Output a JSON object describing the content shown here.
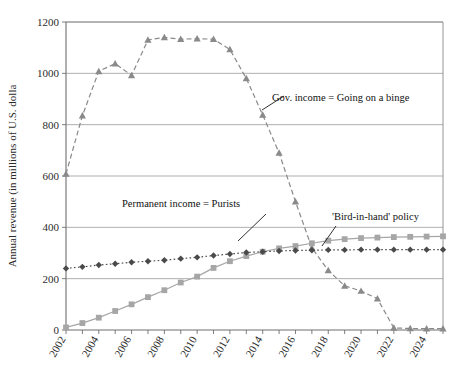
{
  "chart_data": {
    "type": "line",
    "title": "",
    "xlabel": "",
    "ylabel": "Annual revenue (in millions of U.S. dolla",
    "xlim": [
      2002,
      2025
    ],
    "ylim": [
      0,
      1200
    ],
    "yticks": [
      0,
      200,
      400,
      600,
      800,
      1000,
      1200
    ],
    "ytick_labels": [
      "0",
      "200",
      "400",
      "600",
      "800",
      "1000",
      "1200"
    ],
    "xticks": [
      2002,
      2004,
      2006,
      2008,
      2010,
      2012,
      2014,
      2016,
      2018,
      2020,
      2022,
      2024
    ],
    "xtick_labels": [
      "2002",
      "2004",
      "2006",
      "2008",
      "2010",
      "2012",
      "2014",
      "2016",
      "2018",
      "2020",
      "2022",
      "2024"
    ],
    "x": [
      2002,
      2003,
      2004,
      2005,
      2006,
      2007,
      2008,
      2009,
      2010,
      2011,
      2012,
      2013,
      2014,
      2015,
      2016,
      2017,
      2018,
      2019,
      2020,
      2021,
      2022,
      2023,
      2024,
      2025
    ],
    "grid": "horizontal",
    "legend": "none",
    "series": [
      {
        "name": "Gov. income = Going on a binge",
        "marker": "triangle",
        "linestyle": "dashed",
        "color": "#8a8a8a",
        "values": [
          608,
          835,
          1008,
          1038,
          992,
          1130,
          1140,
          1133,
          1135,
          1133,
          1093,
          980,
          838,
          690,
          500,
          320,
          232,
          172,
          152,
          122,
          8,
          6,
          5,
          5
        ]
      },
      {
        "name": "'Bird-in-hand' policy",
        "marker": "square",
        "linestyle": "solid",
        "color": "#a6a6a6",
        "values": [
          10,
          27,
          48,
          74,
          100,
          128,
          155,
          185,
          208,
          242,
          268,
          288,
          305,
          318,
          327,
          338,
          348,
          354,
          358,
          360,
          362,
          363,
          364,
          365
        ]
      },
      {
        "name": "Permanent income = Purists",
        "marker": "diamond",
        "linestyle": "dotted",
        "color": "#4a4a4a",
        "values": [
          240,
          246,
          253,
          258,
          264,
          268,
          272,
          278,
          283,
          290,
          296,
          302,
          305,
          308,
          310,
          311,
          312,
          312,
          313,
          313,
          313,
          313,
          313,
          313
        ]
      }
    ],
    "annotations": [
      {
        "id": "gov-income",
        "text": "Gov. income = Going on a binge",
        "text_x": 272,
        "text_y": 101,
        "leader_from_x": 262,
        "leader_from_y": 110,
        "leader_to_x": 284,
        "leader_to_y": 96
      },
      {
        "id": "permanent-income",
        "text": "Permanent income = Purists",
        "text_x": 122,
        "text_y": 207,
        "leader_from_x": 238,
        "leader_from_y": 241,
        "leader_to_x": 266,
        "leader_to_y": 214
      },
      {
        "id": "bird-in-hand",
        "text": "'Bird-in-hand' policy",
        "text_x": 332,
        "text_y": 220,
        "leader_from_x": 322,
        "leader_from_y": 246,
        "leader_to_x": 336,
        "leader_to_y": 226
      }
    ]
  }
}
